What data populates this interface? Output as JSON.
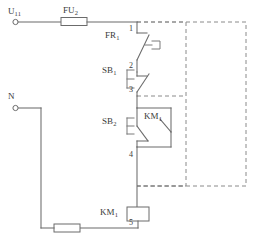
{
  "diagram": {
    "type": "ladder-control-schematic",
    "line_color": "#6b6b6b",
    "dashed_color": "#8a8a8a",
    "background": "#ffffff"
  },
  "terminals": {
    "supply": {
      "label": "U",
      "subscript": "11"
    },
    "neutral": {
      "label": "N",
      "subscript": ""
    }
  },
  "components": {
    "fuse_top": {
      "label": "FU",
      "subscript": "2",
      "kind": "fuse"
    },
    "thermal_relay": {
      "label": "FR",
      "subscript": "1",
      "kind": "thermal-overload-nc-contact"
    },
    "stop_button": {
      "label": "SB",
      "subscript": "1",
      "kind": "push-button-nc"
    },
    "start_button": {
      "label": "SB",
      "subscript": "2",
      "kind": "push-button-no"
    },
    "holding_contact": {
      "label": "KM",
      "subscript": "1",
      "kind": "auxiliary-no-contact"
    },
    "contactor_coil": {
      "label": "KM",
      "subscript": "1",
      "kind": "contactor-coil"
    },
    "fuse_bottom": {
      "label": "",
      "subscript": "",
      "kind": "fuse"
    }
  },
  "node_numbers": {
    "n1": "1",
    "n2": "2",
    "n3": "3",
    "n4": "4",
    "n5": "5"
  }
}
